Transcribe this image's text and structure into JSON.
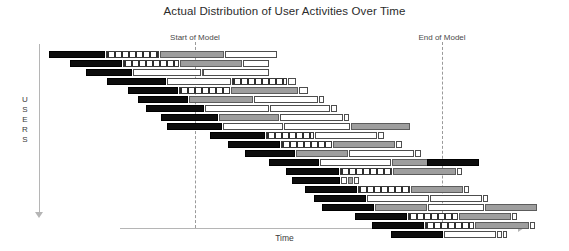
{
  "chart_data": {
    "type": "bar",
    "title": "Actual Distribution of User Activities Over Time",
    "subtitle": "",
    "xlabel": "Time",
    "ylabel": "USERS",
    "ylabel_letters": [
      "U",
      "S",
      "E",
      "R",
      "S"
    ],
    "grid": false,
    "legend_position": "none",
    "orientation": "horizontal-gantt-cascade",
    "xlim": [
      0,
      100
    ],
    "axis_notes": "Unitless relative time axis; bars cascade diagonally from upper-left to lower-right",
    "annotations": [
      {
        "label": "Start of Model",
        "x": 195,
        "label_y": 33,
        "line_top": 42,
        "line_bottom": 228
      },
      {
        "label": "End of Model",
        "x": 442,
        "label_y": 33,
        "line_top": 42,
        "line_bottom": 228
      }
    ],
    "segment_styles": [
      "black",
      "dashed",
      "gray",
      "white"
    ],
    "segment_style_names": {
      "black": "solid-black-activity",
      "dashed": "dashed-pattern-activity",
      "gray": "solid-gray-activity",
      "white": "outlined-white-activity"
    },
    "row_count": 21,
    "rows": [
      {
        "index": 1,
        "y": 51,
        "segments": [
          {
            "style": "black",
            "x": 49,
            "w": 56
          },
          {
            "style": "dashed",
            "x": 106,
            "w": 53
          },
          {
            "style": "gray",
            "x": 160,
            "w": 64
          },
          {
            "style": "white",
            "x": 225,
            "w": 52
          }
        ]
      },
      {
        "index": 2,
        "y": 60,
        "segments": [
          {
            "style": "black",
            "x": 70,
            "w": 52
          },
          {
            "style": "dashed",
            "x": 123,
            "w": 56
          },
          {
            "style": "gray",
            "x": 180,
            "w": 62
          },
          {
            "style": "white",
            "x": 243,
            "w": 26
          }
        ]
      },
      {
        "index": 3,
        "y": 69,
        "segments": [
          {
            "style": "black",
            "x": 86,
            "w": 46
          },
          {
            "style": "white",
            "x": 133,
            "w": 68
          },
          {
            "style": "gray",
            "x": 202,
            "w": 13
          },
          {
            "style": "white",
            "x": 203,
            "w": 66
          }
        ]
      },
      {
        "index": 4,
        "y": 78,
        "segments": [
          {
            "style": "black",
            "x": 107,
            "w": 59
          },
          {
            "style": "white",
            "x": 167,
            "w": 64
          },
          {
            "style": "dashed",
            "x": 232,
            "w": 55
          },
          {
            "style": "white",
            "x": 288,
            "w": 8
          }
        ]
      },
      {
        "index": 5,
        "y": 87,
        "segments": [
          {
            "style": "black",
            "x": 128,
            "w": 50
          },
          {
            "style": "dashed",
            "x": 179,
            "w": 51
          },
          {
            "style": "gray",
            "x": 231,
            "w": 67
          },
          {
            "style": "white",
            "x": 299,
            "w": 9
          }
        ]
      },
      {
        "index": 6,
        "y": 96,
        "segments": [
          {
            "style": "black",
            "x": 138,
            "w": 50
          },
          {
            "style": "gray",
            "x": 189,
            "w": 64
          },
          {
            "style": "white",
            "x": 254,
            "w": 64
          },
          {
            "style": "white",
            "x": 319,
            "w": 5
          }
        ]
      },
      {
        "index": 7,
        "y": 105,
        "segments": [
          {
            "style": "black",
            "x": 146,
            "w": 58
          },
          {
            "style": "white",
            "x": 205,
            "w": 64
          },
          {
            "style": "white",
            "x": 270,
            "w": 60
          },
          {
            "style": "white",
            "x": 331,
            "w": 6
          }
        ]
      },
      {
        "index": 8,
        "y": 114,
        "segments": [
          {
            "style": "black",
            "x": 161,
            "w": 57
          },
          {
            "style": "gray",
            "x": 219,
            "w": 60
          },
          {
            "style": "white",
            "x": 280,
            "w": 63
          },
          {
            "style": "white",
            "x": 344,
            "w": 5
          }
        ]
      },
      {
        "index": 9,
        "y": 123,
        "segments": [
          {
            "style": "black",
            "x": 167,
            "w": 55
          },
          {
            "style": "white",
            "x": 223,
            "w": 60
          },
          {
            "style": "white",
            "x": 284,
            "w": 66
          },
          {
            "style": "gray",
            "x": 351,
            "w": 59
          }
        ]
      },
      {
        "index": 10,
        "y": 132,
        "segments": [
          {
            "style": "black",
            "x": 210,
            "w": 55
          },
          {
            "style": "dashed",
            "x": 266,
            "w": 48
          },
          {
            "style": "white",
            "x": 315,
            "w": 62
          },
          {
            "style": "white",
            "x": 378,
            "w": 6
          }
        ]
      },
      {
        "index": 11,
        "y": 141,
        "segments": [
          {
            "style": "black",
            "x": 228,
            "w": 52
          },
          {
            "style": "dashed",
            "x": 281,
            "w": 51
          },
          {
            "style": "gray",
            "x": 333,
            "w": 62
          },
          {
            "style": "white",
            "x": 396,
            "w": 6
          }
        ]
      },
      {
        "index": 12,
        "y": 150,
        "segments": [
          {
            "style": "black",
            "x": 245,
            "w": 50
          },
          {
            "style": "gray",
            "x": 296,
            "w": 52
          },
          {
            "style": "white",
            "x": 349,
            "w": 65
          },
          {
            "style": "white",
            "x": 415,
            "w": 6
          }
        ]
      },
      {
        "index": 13,
        "y": 159,
        "segments": [
          {
            "style": "black",
            "x": 269,
            "w": 50
          },
          {
            "style": "white",
            "x": 320,
            "w": 71
          },
          {
            "style": "gray",
            "x": 392,
            "w": 52
          },
          {
            "style": "black",
            "x": 427,
            "w": 52
          }
        ]
      },
      {
        "index": 14,
        "y": 168,
        "segments": [
          {
            "style": "black",
            "x": 286,
            "w": 53
          },
          {
            "style": "dashed",
            "x": 340,
            "w": 52
          },
          {
            "style": "gray",
            "x": 393,
            "w": 63
          },
          {
            "style": "white",
            "x": 457,
            "w": 5
          }
        ]
      },
      {
        "index": 15,
        "y": 177,
        "segments": [
          {
            "style": "black",
            "x": 292,
            "w": 48
          },
          {
            "style": "white",
            "x": 341,
            "w": 6
          },
          {
            "style": "gray",
            "x": 348,
            "w": 5
          },
          {
            "style": "white",
            "x": 354,
            "w": 5
          }
        ]
      },
      {
        "index": 16,
        "y": 186,
        "segments": [
          {
            "style": "black",
            "x": 305,
            "w": 52
          },
          {
            "style": "dashed",
            "x": 358,
            "w": 52
          },
          {
            "style": "gray",
            "x": 411,
            "w": 52
          },
          {
            "style": "white",
            "x": 464,
            "w": 5
          }
        ]
      },
      {
        "index": 17,
        "y": 195,
        "segments": [
          {
            "style": "black",
            "x": 314,
            "w": 52
          },
          {
            "style": "white",
            "x": 367,
            "w": 62
          },
          {
            "style": "white",
            "x": 430,
            "w": 52
          },
          {
            "style": "white",
            "x": 483,
            "w": 5
          }
        ]
      },
      {
        "index": 18,
        "y": 204,
        "segments": [
          {
            "style": "black",
            "x": 322,
            "w": 52
          },
          {
            "style": "gray",
            "x": 375,
            "w": 52
          },
          {
            "style": "white",
            "x": 428,
            "w": 56
          },
          {
            "style": "gray",
            "x": 485,
            "w": 52
          }
        ]
      },
      {
        "index": 19,
        "y": 213,
        "segments": [
          {
            "style": "black",
            "x": 355,
            "w": 52
          },
          {
            "style": "dashed",
            "x": 408,
            "w": 50
          },
          {
            "style": "gray",
            "x": 459,
            "w": 52
          },
          {
            "style": "white",
            "x": 512,
            "w": 5
          }
        ]
      },
      {
        "index": 20,
        "y": 222,
        "segments": [
          {
            "style": "black",
            "x": 372,
            "w": 52
          },
          {
            "style": "dashed",
            "x": 425,
            "w": 49
          },
          {
            "style": "gray",
            "x": 475,
            "w": 54
          },
          {
            "style": "white",
            "x": 530,
            "w": 5
          }
        ]
      },
      {
        "index": 21,
        "y": 231,
        "segments": [
          {
            "style": "black",
            "x": 391,
            "w": 52
          },
          {
            "style": "white",
            "x": 444,
            "w": 52
          },
          {
            "style": "white",
            "x": 497,
            "w": 5
          },
          {
            "style": "white",
            "x": 503,
            "w": 4
          }
        ]
      }
    ]
  }
}
